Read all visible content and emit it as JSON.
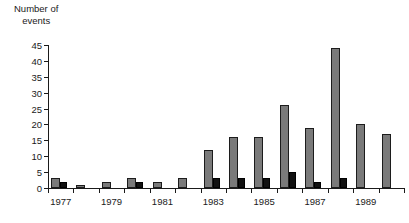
{
  "chart_data": {
    "type": "bar",
    "title": "",
    "ylabel": "Number of events",
    "ylabel_line1": "Number of",
    "ylabel_line2": "events",
    "xlabel": "",
    "categories": [
      "1977",
      "1978",
      "1979",
      "1980",
      "1981",
      "1982",
      "1983",
      "1984",
      "1985",
      "1986",
      "1987",
      "1988",
      "1989",
      "1990"
    ],
    "xtick_labels": [
      "1977",
      "1979",
      "1981",
      "1983",
      "1985",
      "1987",
      "1989"
    ],
    "ytick_labels": [
      "0",
      "5",
      "10",
      "15",
      "20",
      "25",
      "30",
      "35",
      "40",
      "45"
    ],
    "ytick_values": [
      0,
      5,
      10,
      15,
      20,
      25,
      30,
      35,
      40,
      45
    ],
    "ylim": [
      0,
      45
    ],
    "grid": false,
    "legend": "none",
    "series": [
      {
        "name": "gray",
        "color": "#7a7a7a",
        "values": [
          3,
          1,
          2,
          3,
          2,
          3,
          12,
          16,
          16,
          26,
          19,
          44,
          20,
          17
        ]
      },
      {
        "name": "black",
        "color": "#111111",
        "values": [
          2,
          0,
          0,
          2,
          0,
          0,
          3,
          3,
          3,
          5,
          2,
          3,
          0,
          0
        ]
      }
    ]
  },
  "colors": {
    "gray_bar": "#7a7a7a",
    "black_bar": "#111111",
    "axis": "#1a1a1a",
    "background": "#ffffff"
  }
}
